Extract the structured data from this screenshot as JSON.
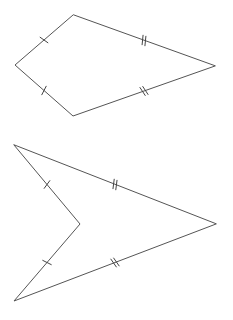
{
  "diagram": {
    "title": "",
    "line_color": "#555555",
    "background": "#ffffff",
    "shapes": [
      {
        "name": "kite",
        "kind": "convex-kite",
        "vertices": [
          "top",
          "left",
          "bottom",
          "right"
        ],
        "sides": [
          {
            "from": "top",
            "to": "left",
            "tick_marks": 1
          },
          {
            "from": "left",
            "to": "bottom",
            "tick_marks": 1
          },
          {
            "from": "bottom",
            "to": "right",
            "tick_marks": 2
          },
          {
            "from": "right",
            "to": "top",
            "tick_marks": 2
          }
        ]
      },
      {
        "name": "dart",
        "kind": "concave-kite",
        "vertices": [
          "top",
          "notch",
          "bottom",
          "right"
        ],
        "sides": [
          {
            "from": "top",
            "to": "notch",
            "tick_marks": 1
          },
          {
            "from": "notch",
            "to": "bottom",
            "tick_marks": 1
          },
          {
            "from": "bottom",
            "to": "right",
            "tick_marks": 2
          },
          {
            "from": "right",
            "to": "top",
            "tick_marks": 2
          }
        ]
      }
    ]
  }
}
